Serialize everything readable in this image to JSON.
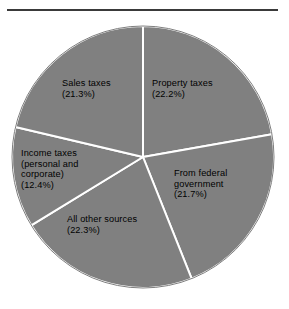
{
  "figure": {
    "rule": "horizontal-rule",
    "background_color": "#ffffff"
  },
  "chart_data": {
    "type": "pie",
    "title": "",
    "subtitle": "",
    "xlabel": "",
    "ylabel": "",
    "grid": false,
    "legend_position": "none",
    "label_placement": "inside-slice",
    "start_angle_deg": 0,
    "direction": "clockwise",
    "slice_fill_color": "#808080",
    "slice_edge_color": "#ffffff",
    "slice_edge_width": 2,
    "categories": [
      "Property taxes",
      "From federal government",
      "All other sources",
      "Income taxes (personal and corporate)",
      "Sales taxes"
    ],
    "values": [
      22.2,
      21.7,
      22.3,
      12.4,
      21.3
    ],
    "units": "percent",
    "total": 99.9,
    "slices": [
      {
        "name": "Property taxes",
        "value": 22.2,
        "percent_text": "(22.2%)",
        "label_lines": [
          "Property taxes",
          "(22.2%)"
        ],
        "color": "#808080"
      },
      {
        "name": "From federal government",
        "value": 21.7,
        "percent_text": "(21.7%)",
        "label_lines": [
          "From federal",
          "government",
          "(21.7%)"
        ],
        "color": "#808080"
      },
      {
        "name": "All other sources",
        "value": 22.3,
        "percent_text": "(22.3%)",
        "label_lines": [
          "All other sources",
          "(22.3%)"
        ],
        "color": "#808080"
      },
      {
        "name": "Income taxes (personal and corporate)",
        "value": 12.4,
        "percent_text": "(12.4%)",
        "label_lines": [
          "Income taxes",
          "(personal and",
          "corporate)",
          "(12.4%)"
        ],
        "color": "#808080"
      },
      {
        "name": "Sales taxes",
        "value": 21.3,
        "percent_text": "(21.3%)",
        "label_lines": [
          "Sales taxes",
          "(21.3%)"
        ],
        "color": "#808080"
      }
    ]
  },
  "labels": {
    "property": "Property taxes\n(22.2%)",
    "federal": "From federal\ngovernment\n(21.7%)",
    "allother": "All other sources\n(22.3%)",
    "income": "Income taxes\n(personal and\ncorporate)\n(12.4%)",
    "sales": "Sales taxes\n(21.3%)"
  }
}
